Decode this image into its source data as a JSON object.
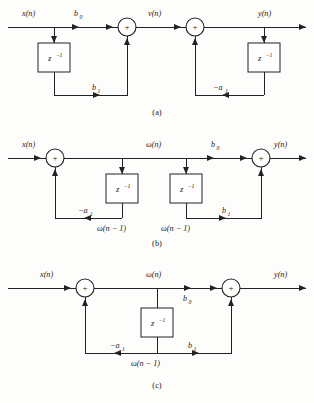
{
  "figure": {
    "kind": "signal-flow-block-diagrams",
    "background_color": "#fdfdfc",
    "line_color": "#222222",
    "panels": [
      {
        "id": "a",
        "caption": "(a)",
        "name": "direct-form-I",
        "labels": {
          "input": "x(n)",
          "output": "y(n)",
          "intermediate": "v(n)",
          "feedforward_gain_0": "b",
          "feedforward_gain_0_sub": "0",
          "feedforward_gain_1": "b",
          "feedforward_gain_1_sub": "1",
          "feedback_gain": "−a",
          "feedback_gain_sub": "1",
          "delay_left": "z",
          "delay_left_exp": "−1",
          "delay_right": "z",
          "delay_right_exp": "−1",
          "adder_symbol": "+"
        }
      },
      {
        "id": "b",
        "caption": "(b)",
        "name": "direct-form-II-uncombined",
        "labels": {
          "input": "x(n)",
          "output": "y(n)",
          "state": "ω(n)",
          "state_delayed_left": "ω(n − 1)",
          "state_delayed_right": "ω(n − 1)",
          "feedback_gain": "−a",
          "feedback_gain_sub": "1",
          "feedforward_gain_0": "b",
          "feedforward_gain_0_sub": "0",
          "feedforward_gain_1": "b",
          "feedforward_gain_1_sub": "1",
          "delay_left": "z",
          "delay_left_exp": "−1",
          "delay_right": "z",
          "delay_right_exp": "−1",
          "adder_symbol": "+"
        }
      },
      {
        "id": "c",
        "caption": "(c)",
        "name": "direct-form-II-canonical",
        "labels": {
          "input": "x(n)",
          "output": "y(n)",
          "state": "ω(n)",
          "state_delayed": "ω(n − 1)",
          "feedback_gain": "−a",
          "feedback_gain_sub": "1",
          "feedforward_gain_0": "b",
          "feedforward_gain_0_sub": "0",
          "feedforward_gain_1": "b",
          "feedforward_gain_1_sub": "1",
          "delay": "z",
          "delay_exp": "−1",
          "adder_symbol": "+"
        }
      }
    ]
  }
}
